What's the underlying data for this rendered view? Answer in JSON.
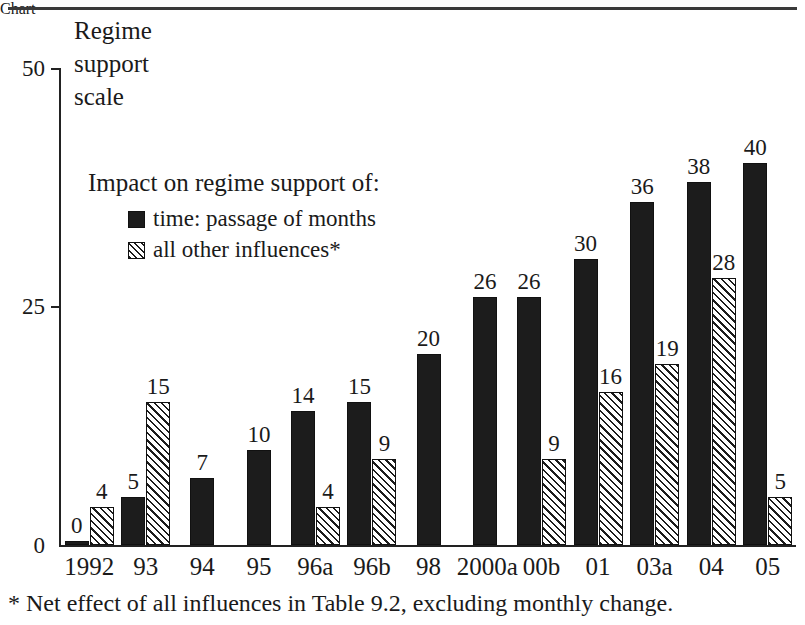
{
  "axis_title": "Regime\nsupport\nscale",
  "legend": {
    "title": "Impact on regime support of:",
    "entries": [
      {
        "swatch": "solid-square-icon",
        "label": "time: passage of months"
      },
      {
        "swatch": "hatched-square-icon",
        "label": "all other influences*"
      }
    ]
  },
  "footnote": "* Net effect of all influences in Table 9.2, excluding monthly change.",
  "y_ticks": [
    {
      "value": 50,
      "label": "50"
    },
    {
      "value": 25,
      "label": "25"
    },
    {
      "value": 0,
      "label": "0"
    }
  ],
  "chart_data": {
    "type": "bar",
    "title": "Regime support scale",
    "subtitle": "Impact on regime support of:",
    "xlabel": "",
    "ylabel": "Regime support scale",
    "ylim": [
      0,
      50
    ],
    "ytick_values": [
      0,
      25,
      50
    ],
    "grid": false,
    "legend_position": "inside-upper-left",
    "annotations": [
      "* Net effect of all influences in Table 9.2, excluding monthly change."
    ],
    "categories": [
      "1992",
      "93",
      "94",
      "95",
      "96a",
      "96b",
      "98",
      "2000a",
      "00b",
      "01",
      "03a",
      "04",
      "05"
    ],
    "series": [
      {
        "name": "time: passage of months",
        "style": "solid-black",
        "values": [
          0,
          5,
          7,
          10,
          14,
          15,
          20,
          26,
          26,
          30,
          36,
          38,
          40
        ],
        "labels": [
          "0",
          "5",
          "7",
          "10",
          "14",
          "15",
          "20",
          "26",
          "26",
          "30",
          "36",
          "38",
          "40"
        ]
      },
      {
        "name": "all other influences*",
        "style": "diagonal-hatch",
        "values": [
          4,
          15,
          null,
          null,
          4,
          9,
          null,
          null,
          9,
          16,
          19,
          28,
          5
        ],
        "labels": [
          "4",
          "15",
          "",
          "",
          "4",
          "9",
          "",
          "",
          "9",
          "16",
          "19",
          "28",
          "5"
        ]
      }
    ]
  },
  "colors": {
    "ink": "#1c1c1c",
    "axis": "#222222",
    "background": "#ffffff"
  }
}
